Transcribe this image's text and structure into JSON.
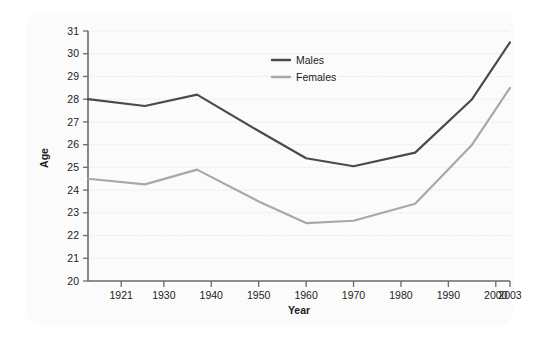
{
  "chart_data": {
    "type": "line",
    "title": "",
    "xlabel": "Year",
    "ylabel": "Age",
    "xlim": [
      1914,
      2003
    ],
    "ylim": [
      20,
      31
    ],
    "grid": true,
    "legend_position": "top-center",
    "xticks": [
      "1921",
      "1930",
      "1940",
      "1950",
      "1960",
      "1970",
      "1980",
      "1990",
      "2000",
      "2003"
    ],
    "yticks": [
      "20",
      "21",
      "22",
      "23",
      "24",
      "25",
      "26",
      "27",
      "28",
      "29",
      "30",
      "31"
    ],
    "x": [
      1914,
      1926,
      1937,
      1950,
      1960,
      1970,
      1983,
      1995,
      2003
    ],
    "series": [
      {
        "name": "Males",
        "color": "#4a4a4a",
        "values": [
          28.0,
          27.7,
          28.2,
          26.6,
          25.4,
          25.05,
          25.65,
          28.0,
          30.5
        ]
      },
      {
        "name": "Females",
        "color": "#a8a8a8",
        "values": [
          24.5,
          24.25,
          24.9,
          23.5,
          22.55,
          22.65,
          23.4,
          26.0,
          28.5
        ]
      }
    ]
  },
  "legend": {
    "items": [
      {
        "label": "Males"
      },
      {
        "label": "Females"
      }
    ]
  },
  "axes": {
    "y_title": "Age",
    "x_title": "Year"
  },
  "colors": {
    "males": "#4a4a4a",
    "females": "#a8a8a8",
    "axis": "#6b6b6b",
    "grid": "#d9d9d9",
    "panel": "#fbfbfb",
    "background": "#ffffff"
  }
}
